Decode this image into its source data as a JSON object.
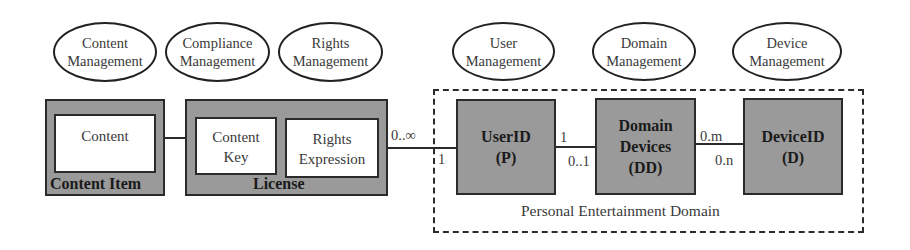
{
  "management_ellipses": [
    {
      "line1": "Content",
      "line2": "Management"
    },
    {
      "line1": "Compliance",
      "line2": "Management"
    },
    {
      "line1": "Rights",
      "line2": "Management"
    },
    {
      "line1": "User",
      "line2": "Management"
    },
    {
      "line1": "Domain",
      "line2": "Management"
    },
    {
      "line1": "Device",
      "line2": "Management"
    }
  ],
  "content_item": {
    "title": "Content Item",
    "inner": "Content"
  },
  "license": {
    "title": "License",
    "content_key": {
      "line1": "Content",
      "line2": "Key"
    },
    "rights_expression": {
      "line1": "Rights",
      "line2": "Expression"
    }
  },
  "entities": {
    "user": {
      "line1": "UserID",
      "line2": "(P)"
    },
    "domain_devices": {
      "line1": "Domain",
      "line2": "Devices",
      "line3": "(DD)"
    },
    "device": {
      "line1": "DeviceID",
      "line2": "(D)"
    }
  },
  "multiplicities": {
    "license_side": "0..∞",
    "user_side_from_license": "1",
    "user_to_dd": "1",
    "dd_from_user": "0..1",
    "dd_to_device": "0.m",
    "device_from_dd": "0.n"
  },
  "domain_boundary": {
    "label": "Personal Entertainment Domain"
  },
  "colors": {
    "entity_fill": "#9a9a9a",
    "stroke": "#2b2b2b",
    "background": "#ffffff"
  }
}
